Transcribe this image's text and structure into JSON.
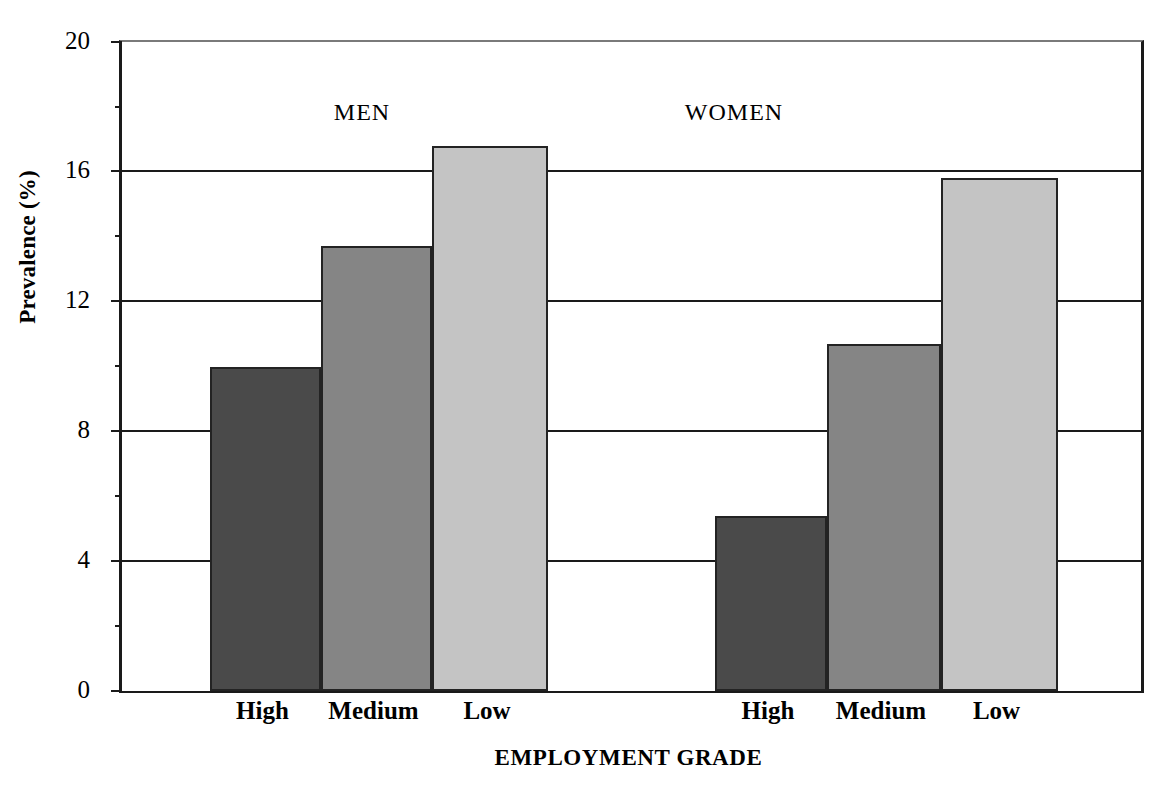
{
  "chart_data": {
    "type": "bar",
    "title": "",
    "xlabel": "EMPLOYMENT GRADE",
    "ylabel": "Prevalence (%)",
    "categories": [
      "High",
      "Medium",
      "Low"
    ],
    "groups": [
      "MEN",
      "WOMEN"
    ],
    "series": [
      {
        "name": "MEN",
        "categories": [
          "High",
          "Medium",
          "Low"
        ],
        "values": [
          10.0,
          13.7,
          16.8
        ]
      },
      {
        "name": "WOMEN",
        "categories": [
          "High",
          "Medium",
          "Low"
        ],
        "values": [
          5.4,
          10.7,
          15.8
        ]
      }
    ],
    "ylim": [
      0,
      20
    ],
    "ytick_labels": [
      "0",
      "4",
      "8",
      "12",
      "16",
      "20"
    ],
    "ytick_values": [
      0,
      4,
      8,
      12,
      16,
      20
    ],
    "yminor_values": [
      2,
      6,
      10,
      14,
      18
    ],
    "grid": "horizontal",
    "legend": "none",
    "bar_colors": {
      "High": "#4a4a4a",
      "Medium": "#858585",
      "Low": "#c4c4c4"
    },
    "frame_color": "#1a1a1a"
  },
  "axis": {
    "y_label": "Prevalence (%)",
    "x_label": "EMPLOYMENT GRADE"
  },
  "groups": [
    {
      "label": "MEN"
    },
    {
      "label": "WOMEN"
    }
  ],
  "ticks": [
    {
      "label": "20"
    },
    {
      "label": "16"
    },
    {
      "label": "12"
    },
    {
      "label": "8"
    },
    {
      "label": "4"
    },
    {
      "label": "0"
    }
  ],
  "bars": [
    {
      "label": "High",
      "group": "MEN",
      "value": 10.0
    },
    {
      "label": "Medium",
      "group": "MEN",
      "value": 13.7
    },
    {
      "label": "Low",
      "group": "MEN",
      "value": 16.8
    },
    {
      "label": "High",
      "group": "WOMEN",
      "value": 5.4
    },
    {
      "label": "Medium",
      "group": "WOMEN",
      "value": 10.7
    },
    {
      "label": "Low",
      "group": "WOMEN",
      "value": 15.8
    }
  ]
}
